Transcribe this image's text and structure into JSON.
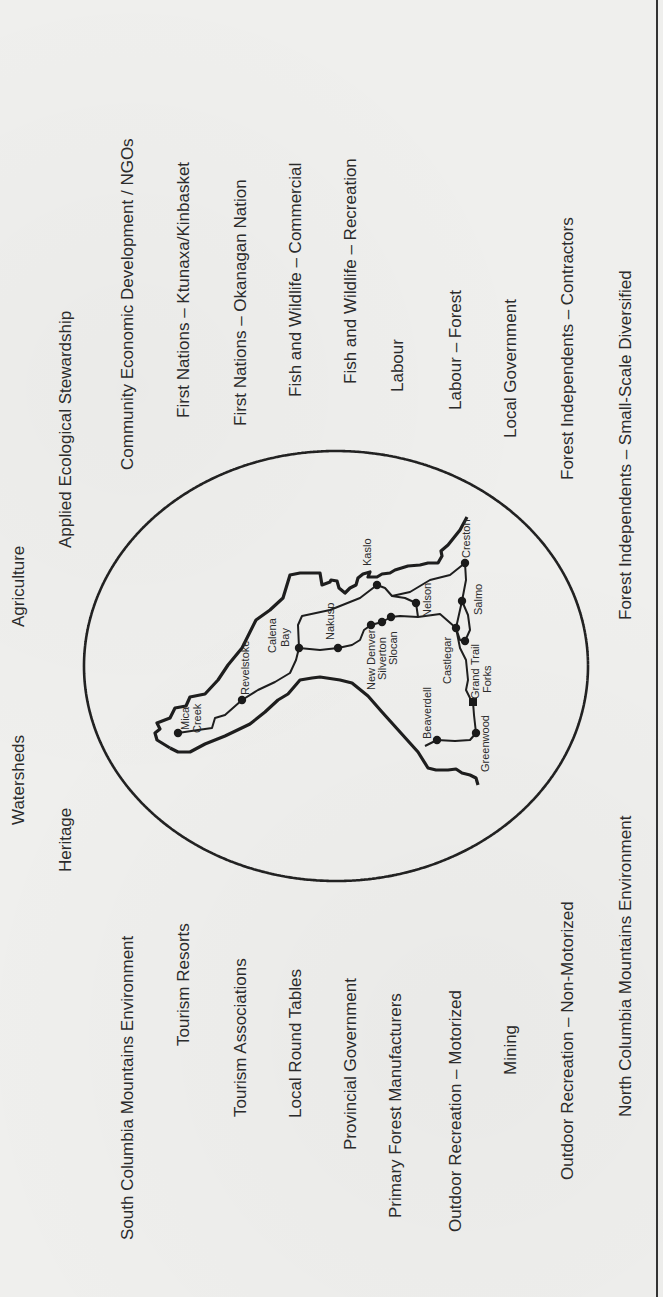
{
  "diagram": {
    "orientation": "rotated -90deg (text reads bottom to top)",
    "upper_labels": [
      {
        "id": "agriculture",
        "text": "Agriculture",
        "x": 9,
        "y": 627
      },
      {
        "id": "applied-ecological-stewardship",
        "text": "Applied Ecological Stewardship",
        "x": 56,
        "y": 548
      },
      {
        "id": "community-economic-development",
        "text": "Community Economic Development / NGOs",
        "x": 118,
        "y": 470
      },
      {
        "id": "first-nations-ktunaxa",
        "text": "First Nations – Ktunaxa/Kinbasket",
        "x": 174,
        "y": 418
      },
      {
        "id": "first-nations-okanagan",
        "text": "First Nations – Okanagan Nation",
        "x": 231,
        "y": 426
      },
      {
        "id": "fish-wildlife-commercial",
        "text": "Fish and Wildlife – Commercial",
        "x": 286,
        "y": 397
      },
      {
        "id": "fish-wildlife-recreation",
        "text": "Fish and Wildlife – Recreation",
        "x": 341,
        "y": 384
      },
      {
        "id": "labour",
        "text": "Labour",
        "x": 388,
        "y": 392
      },
      {
        "id": "labour-forest",
        "text": "Labour – Forest",
        "x": 446,
        "y": 410
      },
      {
        "id": "local-government",
        "text": "Local Government",
        "x": 501,
        "y": 438
      },
      {
        "id": "forest-independents-contractors",
        "text": "Forest Independents – Contractors",
        "x": 558,
        "y": 480
      },
      {
        "id": "forest-independents-small-scale",
        "text": "Forest Independents – Small-Scale Diversified",
        "x": 616,
        "y": 620
      }
    ],
    "lower_labels": [
      {
        "id": "watersheds",
        "text": "Watersheds",
        "x": 9,
        "y": 825
      },
      {
        "id": "heritage",
        "text": "Heritage",
        "x": 56,
        "y": 872
      },
      {
        "id": "south-columbia-mountains-environment",
        "text": "South Columbia Mountains Environment",
        "x": 118,
        "y": 1240
      },
      {
        "id": "tourism-resorts",
        "text": "Tourism Resorts",
        "x": 174,
        "y": 1046
      },
      {
        "id": "tourism-associations",
        "text": "Tourism Associations",
        "x": 231,
        "y": 1117
      },
      {
        "id": "local-round-tables",
        "text": "Local Round Tables",
        "x": 286,
        "y": 1118
      },
      {
        "id": "provincial-government",
        "text": "Provincial Government",
        "x": 341,
        "y": 1150
      },
      {
        "id": "primary-forest-manufacturers",
        "text": "Primary Forest Manufacturers",
        "x": 386,
        "y": 1218
      },
      {
        "id": "outdoor-recreation-motorized",
        "text": "Outdoor Recreation – Motorized",
        "x": 446,
        "y": 1232
      },
      {
        "id": "mining",
        "text": "Mining",
        "x": 501,
        "y": 1075
      },
      {
        "id": "outdoor-recreation-non-motorized",
        "text": "Outdoor Recreation – Non-Motorized",
        "x": 558,
        "y": 1180
      },
      {
        "id": "north-columbia-mountains-environment",
        "text": "North Columbia Mountains Environment",
        "x": 616,
        "y": 1117
      }
    ],
    "map": {
      "boundary": "dotted ellipse",
      "cities": [
        {
          "name": "Mica Creek",
          "lines": [
            "Mica",
            "Creek"
          ]
        },
        {
          "name": "Revelstoke",
          "lines": [
            "Revelstoke"
          ]
        },
        {
          "name": "Calena Bay",
          "lines": [
            "Calena",
            "Bay"
          ]
        },
        {
          "name": "Nakusp",
          "lines": [
            "Nakusp"
          ]
        },
        {
          "name": "New Denver",
          "lines": [
            "New Denver"
          ]
        },
        {
          "name": "Silverton",
          "lines": [
            "Silverton"
          ]
        },
        {
          "name": "Slocan",
          "lines": [
            "Slocan"
          ]
        },
        {
          "name": "Kaslo",
          "lines": [
            "Kaslo"
          ]
        },
        {
          "name": "Nelson",
          "lines": [
            "Nelson"
          ]
        },
        {
          "name": "Creston",
          "lines": [
            "Creston"
          ]
        },
        {
          "name": "Salmo",
          "lines": [
            "Salmo"
          ]
        },
        {
          "name": "Castlegar",
          "lines": [
            "Castlegar"
          ]
        },
        {
          "name": "Trail",
          "lines": [
            "Trail"
          ]
        },
        {
          "name": "Grand Forks",
          "lines": [
            "Grand",
            "Forks"
          ]
        },
        {
          "name": "Greenwood",
          "lines": [
            "Greenwood"
          ]
        },
        {
          "name": "Beaverdell",
          "lines": [
            "Beaverdell"
          ]
        }
      ]
    }
  }
}
